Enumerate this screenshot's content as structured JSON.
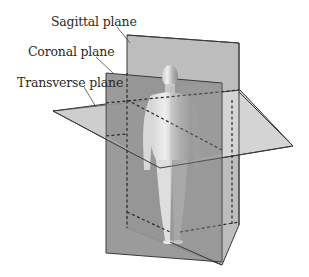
{
  "figure": {
    "labels": [
      {
        "id": "sagittal",
        "text": "Sagittal plane"
      },
      {
        "id": "coronal",
        "text": "Coronal plane"
      },
      {
        "id": "transverse",
        "text": "Transverse plane"
      }
    ],
    "colors": {
      "background": "#ffffff",
      "sagittal_fill": "#b9b9b9",
      "coronal_fill": "#8f8f8f",
      "transverse_fill": "#d2d2d2",
      "edge": "#3a3a3a",
      "label_text": "#2a2a2a",
      "figure_light": "#e6e6e6",
      "figure_dark": "#9a9a9a"
    }
  }
}
